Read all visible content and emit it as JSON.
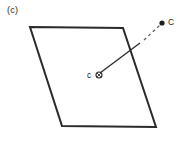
{
  "figure": {
    "panel_label": "(c)",
    "background_color": "#ffffff",
    "stroke_color": "#2b2b2b",
    "width": 184,
    "height": 144
  },
  "diagram": {
    "type": "geometric-schematic",
    "shape": {
      "name": "parallelogram",
      "stroke_width": 2,
      "fill": "none",
      "vertices": [
        {
          "name": "top-left",
          "x": 30,
          "y": 27
        },
        {
          "name": "top-right",
          "x": 123,
          "y": 28
        },
        {
          "name": "bottom-right",
          "x": 156,
          "y": 127
        },
        {
          "name": "bottom-left",
          "x": 62,
          "y": 126
        }
      ]
    },
    "points": [
      {
        "id": "c-lower",
        "label": "c",
        "marker": "circle-open-with-cross",
        "x": 99,
        "y": 75,
        "radius": 3,
        "label_x": 87,
        "label_y": 70
      },
      {
        "id": "C-upper",
        "label": "C",
        "marker": "filled-dot",
        "x": 162,
        "y": 23,
        "radius": 2.6,
        "label_x": 168,
        "label_y": 17
      }
    ],
    "connector": {
      "name": "c-to-C-vector",
      "from": "c-lower",
      "to": "C-upper",
      "solid_segment": {
        "x1": 100,
        "y1": 73,
        "x2": 140,
        "y2": 43
      },
      "dashed_segment": {
        "x1": 144,
        "y1": 40,
        "x2": 160,
        "y2": 25
      },
      "dash_pattern": "3 3",
      "stroke_width": 1.3
    }
  }
}
